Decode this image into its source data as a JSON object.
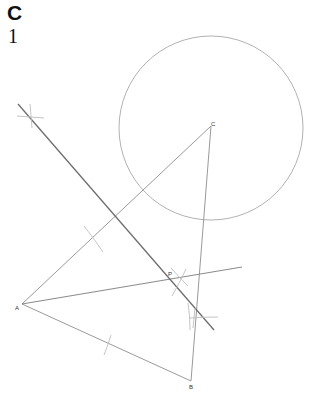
{
  "header": {
    "letter": "C",
    "number": "1"
  },
  "figure": {
    "points": {
      "A": {
        "label": "A",
        "x": 22,
        "y": 304
      },
      "B": {
        "label": "B",
        "x": 191,
        "y": 381
      },
      "C": {
        "label": "C",
        "x": 211,
        "y": 126
      },
      "P": {
        "label": "P",
        "x": 170,
        "y": 274
      }
    },
    "circle": {
      "cx": 211,
      "cy": 128,
      "r": 92
    },
    "colors": {
      "line": "#9a9a9a",
      "dark_line": "#6e6e6e",
      "arc": "#bdbdbd"
    }
  }
}
